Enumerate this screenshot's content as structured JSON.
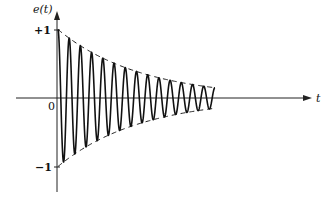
{
  "chart_data": {
    "type": "line",
    "title": "",
    "subtitle": "",
    "xlabel": "t",
    "ylabel": "e(t)",
    "y_ticks": [
      {
        "value": 1,
        "label": "+1"
      },
      {
        "value": -1,
        "label": "-1"
      }
    ],
    "x_ticks": [
      {
        "value": 0,
        "label": "0"
      }
    ],
    "ylim": [
      -1.3,
      1.3
    ],
    "xlim": [
      0,
      1
    ],
    "grid": false,
    "legend": null,
    "series": [
      {
        "name": "e(t)",
        "style": "solid",
        "function": "e^(-a t) cos(2π f t)",
        "cycles": 14,
        "start_value": 1,
        "end_envelope": 0.15
      },
      {
        "name": "upper envelope",
        "style": "dashed",
        "function": "+e^(-a t)",
        "start_value": 1,
        "end_value": 0.15
      },
      {
        "name": "lower envelope",
        "style": "dashed",
        "function": "-e^(-a t)",
        "start_value": -1,
        "end_value": -0.15
      }
    ]
  },
  "labels": {
    "y_axis": "e(t)",
    "x_axis": "t",
    "plus_one": "+1",
    "minus_one": "−1",
    "origin": "0"
  }
}
